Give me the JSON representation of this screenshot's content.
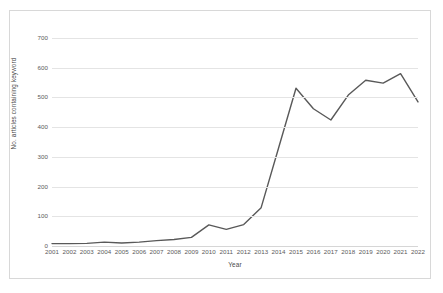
{
  "chart_data": {
    "type": "line",
    "title": "",
    "xlabel": "Year",
    "ylabel": "No. articles containing keyword",
    "categories": [
      "2001",
      "2002",
      "2003",
      "2004",
      "2005",
      "2006",
      "2007",
      "2008",
      "2009",
      "2010",
      "2011",
      "2012",
      "2013",
      "2014",
      "2015",
      "2016",
      "2017",
      "2018",
      "2019",
      "2020",
      "2021",
      "2022"
    ],
    "values": [
      8,
      8,
      9,
      13,
      10,
      13,
      18,
      22,
      29,
      71,
      56,
      72,
      129,
      330,
      531,
      462,
      424,
      508,
      558,
      548,
      580,
      485
    ],
    "series": [
      {
        "name": "No. articles containing keyword",
        "values": [
          8,
          8,
          9,
          13,
          10,
          13,
          18,
          22,
          29,
          71,
          56,
          72,
          129,
          330,
          531,
          462,
          424,
          508,
          558,
          548,
          580,
          485
        ]
      }
    ],
    "x": [
      "2001",
      "2002",
      "2003",
      "2004",
      "2005",
      "2006",
      "2007",
      "2008",
      "2009",
      "2010",
      "2011",
      "2012",
      "2013",
      "2014",
      "2015",
      "2016",
      "2017",
      "2018",
      "2019",
      "2020",
      "2021",
      "2022"
    ],
    "ylim": [
      0,
      700
    ],
    "yticks": [
      0,
      100,
      200,
      300,
      400,
      500,
      600,
      700
    ],
    "ytick_labels": [
      "0",
      "100",
      "200",
      "300",
      "400",
      "500",
      "600",
      "700"
    ],
    "xtick_labels": [
      "2001",
      "2002",
      "2003",
      "2004",
      "2005",
      "2006",
      "2007",
      "2008",
      "2009",
      "2010",
      "2011",
      "2012",
      "2013",
      "2014",
      "2015",
      "2016",
      "2017",
      "2018",
      "2019",
      "2020",
      "2021",
      "2022"
    ],
    "grid": true,
    "grid_axis": "y",
    "legend": false,
    "legend_position": "none",
    "line_color": "#595959",
    "grid_color": "#e4e4e4",
    "background_color": "#ffffff",
    "border_color": "#d8d8d8",
    "markers": false,
    "annotations": []
  }
}
